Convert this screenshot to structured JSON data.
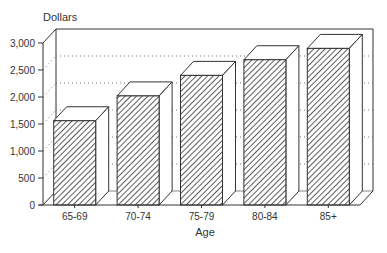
{
  "chart_data": {
    "type": "bar",
    "style": "3d-hatched",
    "title": "",
    "ylabel": "Dollars",
    "xlabel": "Age",
    "categories": [
      "65-69",
      "70-74",
      "75-79",
      "80-84",
      "85+"
    ],
    "values": [
      1560,
      2020,
      2400,
      2690,
      2900
    ],
    "ylim": [
      0,
      3000
    ],
    "yticks": [
      0,
      500,
      1000,
      1500,
      2000,
      2500,
      3000
    ],
    "ytick_labels": [
      "0",
      "500",
      "1,000",
      "1,500",
      "2,000",
      "2,500",
      "3,000"
    ],
    "grid": "dotted horizontal on back wall",
    "legend": "none"
  },
  "colors": {
    "line": "#333333",
    "grid": "#777777",
    "fill": "#ffffff"
  }
}
